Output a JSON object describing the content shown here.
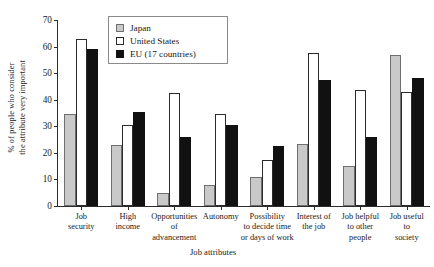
{
  "chart_data": {
    "type": "bar",
    "title": "",
    "xlabel": "Job attributes",
    "ylabel_line1": "% of people who consider",
    "ylabel_line2": "the attribute very important",
    "ylim": [
      0,
      70
    ],
    "yticks": [
      0,
      10,
      20,
      30,
      40,
      50,
      60,
      70
    ],
    "grid": false,
    "legend_position": "top-center",
    "categories": [
      "Job security",
      "High income",
      "Opportunities of advancement",
      "Autonomy",
      "Possibility to decide time or days of work",
      "Interest of the job",
      "Job helpful to other people",
      "Job useful to society"
    ],
    "category_lines": [
      [
        "Job",
        "security"
      ],
      [
        "High",
        "income"
      ],
      [
        "Opportunities",
        "of",
        "advancement"
      ],
      [
        "Autonomy"
      ],
      [
        "Possibility",
        "to decide time",
        "or days of work"
      ],
      [
        "Interest of",
        "the job"
      ],
      [
        "Job helpful",
        "to other",
        "people"
      ],
      [
        "Job useful",
        "to",
        "society"
      ]
    ],
    "series": [
      {
        "name": "Japan",
        "color": "#c9c9c9",
        "values": [
          34.5,
          23,
          5,
          8,
          11,
          23.5,
          15,
          57
        ]
      },
      {
        "name": "United States",
        "color": "#ffffff",
        "values": [
          63,
          30.5,
          42.5,
          34.5,
          17.5,
          57.5,
          43.5,
          43
        ]
      },
      {
        "name": "EU (17 countries)",
        "color": "#111111",
        "values": [
          59,
          35.5,
          26,
          30.5,
          22.5,
          47.5,
          26,
          48
        ]
      }
    ]
  }
}
